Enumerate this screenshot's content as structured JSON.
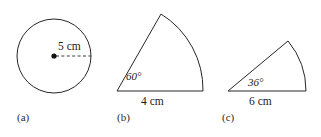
{
  "figure": {
    "background_color": "#ffffff",
    "stroke_color": "#262626",
    "text_color": "#1a1a1a",
    "panels": [
      {
        "key": "a",
        "panel_label": "(a)",
        "shape": "circle",
        "radius_label": "5 cm",
        "radius_value": 5,
        "unit": "cm",
        "angle_label": "",
        "has_dashed_radius": true,
        "has_center_dot": true
      },
      {
        "key": "b",
        "panel_label": "(b)",
        "shape": "sector",
        "radius_label": "4 cm",
        "radius_value": 4,
        "unit": "cm",
        "angle_label": "60°",
        "angle_value": 60,
        "has_dashed_radius": false,
        "has_center_dot": false
      },
      {
        "key": "c",
        "panel_label": "(c)",
        "shape": "sector",
        "radius_label": "6 cm",
        "radius_value": 6,
        "unit": "cm",
        "angle_label": "36°",
        "angle_value": 36,
        "has_dashed_radius": false,
        "has_center_dot": false
      }
    ]
  }
}
